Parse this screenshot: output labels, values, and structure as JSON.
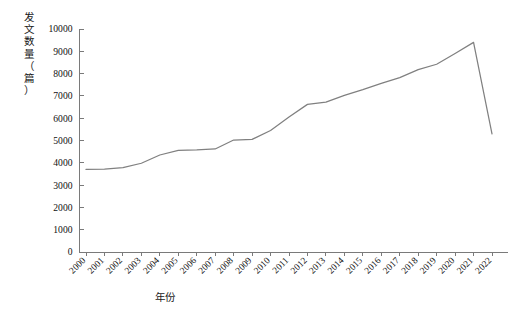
{
  "chart_data": {
    "type": "line",
    "title": "",
    "xlabel": "年份",
    "ylabel": "发文数量（篇）",
    "ylabel_chars": "发\n文\n数\n量\n（\n篇\n）",
    "categories": [
      "2000",
      "2001",
      "2002",
      "2003",
      "2004",
      "2005",
      "2006",
      "2007",
      "2008",
      "2009",
      "2010",
      "2011",
      "2012",
      "2013",
      "2014",
      "2015",
      "2016",
      "2017",
      "2018",
      "2019",
      "2020",
      "2021",
      "2022"
    ],
    "x": [
      2000,
      2001,
      2002,
      2003,
      2004,
      2005,
      2006,
      2007,
      2008,
      2009,
      2010,
      2011,
      2012,
      2013,
      2014,
      2015,
      2016,
      2017,
      2018,
      2019,
      2020,
      2021,
      2022
    ],
    "values": [
      3700,
      3720,
      3780,
      3980,
      4350,
      4560,
      4580,
      4620,
      5020,
      5050,
      5450,
      6050,
      6620,
      6720,
      7020,
      7280,
      7560,
      7820,
      8180,
      8420,
      8900,
      9400,
      5300
    ],
    "series": [
      {
        "name": "发文数量",
        "color": "#808080",
        "values": [
          3700,
          3720,
          3780,
          3980,
          4350,
          4560,
          4580,
          4620,
          5020,
          5050,
          5450,
          6050,
          6620,
          6720,
          7020,
          7280,
          7560,
          7820,
          8180,
          8420,
          8900,
          9400,
          5300
        ]
      }
    ],
    "ylim": [
      0,
      10000
    ],
    "ytick_values": [
      0,
      1000,
      2000,
      3000,
      4000,
      5000,
      6000,
      7000,
      8000,
      9000,
      10000
    ],
    "ytick_labels": [
      "0",
      "1000",
      "2000",
      "3000",
      "4000",
      "5000",
      "6000",
      "7000",
      "8000",
      "9000",
      "10000"
    ],
    "grid": false,
    "legend": false,
    "legend_position": "none",
    "xtick_rotation": 45,
    "line_color": "#808080",
    "axis_color": "#7a7a7a",
    "background_color": "#ffffff"
  }
}
